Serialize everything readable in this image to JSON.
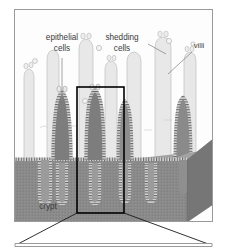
{
  "figure": {
    "domain": "Diagram",
    "width": 227,
    "height": 247,
    "background_color": "#ffffff"
  },
  "frame": {
    "outer_border_color": "#9a9a9a",
    "outer_border_width": 1,
    "x": 14,
    "y": 9,
    "width": 199,
    "height": 213
  },
  "lower_frame": {
    "border_color": "#9a9a9a",
    "x": 14,
    "y": 243,
    "width": 199,
    "height": 4
  },
  "labels": [
    {
      "id": "epithelial-cells",
      "line1": "epithelial",
      "line2": "cells",
      "x": 62,
      "y": 44,
      "leader_from_x": 62,
      "leader_from_y": 58,
      "leader_to_x": 62,
      "leader_to_y": 100
    },
    {
      "id": "shedding-cells",
      "line1": "shedding",
      "line2": "cells",
      "x": 122,
      "y": 44,
      "leader_from_x": 148,
      "leader_from_y": 44,
      "leader_to_x": 166,
      "leader_to_y": 54
    },
    {
      "id": "villi",
      "line1": "villi",
      "line2": "",
      "x": 196,
      "y": 48,
      "leader_from_x": 192,
      "leader_from_y": 52,
      "leader_to_x": 168,
      "leader_to_y": 74
    },
    {
      "id": "crypt",
      "line1": "crypt",
      "line2": "",
      "x": 48,
      "y": 207,
      "leader_from_x": 0,
      "leader_from_y": 0,
      "leader_to_x": 0,
      "leader_to_y": 0
    }
  ],
  "inset_box": {
    "label": "magnified-region",
    "x": 77,
    "y": 87,
    "width": 47,
    "height": 126,
    "stroke_color": "#000000",
    "stroke_width": 1.6
  },
  "magnification_lines": {
    "left_from_x": 77,
    "left_from_y": 213,
    "left_to_x": 16,
    "left_to_y": 245,
    "right_from_x": 124,
    "right_from_y": 213,
    "right_to_x": 211,
    "right_to_y": 245
  },
  "colors": {
    "villus_fill": "#ededed",
    "villus_fill_back": "#e3e3e3",
    "villus_outline": "#b4b4b4",
    "tissue_block_top": "#9d9d9d",
    "tissue_block_front": "#8a8a8a",
    "tissue_block_side": "#757575",
    "crypt_core": "#7b7b7b",
    "epithelium_stripe": "#5a5a5a",
    "epithelium_band": "#d8d8d8",
    "label_color": "#3a3a3a",
    "leader_color": "#8c8c8c",
    "inset_stroke": "#000000"
  },
  "structures": {
    "back_villi_count": 7,
    "front_villi_count": 5,
    "crypt_count": 5,
    "shed_cell_count": 8
  }
}
